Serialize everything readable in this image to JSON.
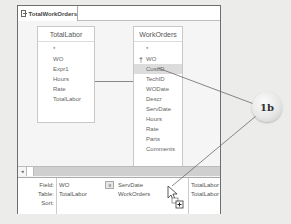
{
  "window": {
    "tab_label": "TotalWorkOrders"
  },
  "field_lists": [
    {
      "title": "TotalLabor",
      "items": [
        {
          "label": "*"
        },
        {
          "label": "WO"
        },
        {
          "label": "Expr1"
        },
        {
          "label": "Hours"
        },
        {
          "label": "Rate"
        },
        {
          "label": "TotalLabor"
        }
      ]
    },
    {
      "title": "WorkOrders",
      "items": [
        {
          "label": "*"
        },
        {
          "label": "WO",
          "key": true
        },
        {
          "label": "CustID",
          "selected": true
        },
        {
          "label": "TechID"
        },
        {
          "label": "WODate"
        },
        {
          "label": "Descr"
        },
        {
          "label": "ServDate"
        },
        {
          "label": "Hours"
        },
        {
          "label": "Rate"
        },
        {
          "label": "Parts"
        },
        {
          "label": "Comments"
        }
      ]
    }
  ],
  "grid": {
    "row_labels": {
      "field": "Field:",
      "table": "Table:",
      "sort": "Sort:"
    },
    "columns": [
      {
        "field": "WO",
        "table": "TotalLabor"
      },
      {
        "field": "ServDate",
        "table": "WorkOrders"
      },
      {
        "field": "TotalLabor",
        "table": "TotalLabor"
      }
    ],
    "dropdown_glyph": "∨"
  },
  "scrollbar": {
    "left_arrow": "◂"
  },
  "callout": {
    "label": "1b"
  },
  "icons": {
    "key": "†"
  }
}
